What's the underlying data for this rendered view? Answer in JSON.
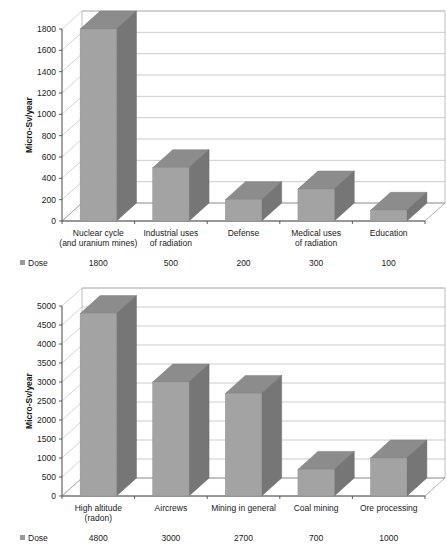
{
  "chart_data": [
    {
      "type": "bar",
      "title": "",
      "xlabel": "",
      "ylabel": "Micro-Sv/year",
      "ylim": [
        0,
        1800
      ],
      "ytick_step": 200,
      "yticks": [
        0,
        200,
        400,
        600,
        800,
        1000,
        1200,
        1400,
        1600,
        1800
      ],
      "grid": true,
      "legend": "Dose",
      "legend_position": "bottom-left",
      "categories": [
        "Nuclear cycle\n(and uranium mines)",
        "Industrial uses\nof radiation",
        "Defense",
        "Medical uses\nof radiation",
        "Education"
      ],
      "category_lines": [
        [
          "Nuclear cycle",
          "(and uranium mines)"
        ],
        [
          "Industrial uses",
          "of radiation"
        ],
        [
          "Defense",
          ""
        ],
        [
          "Medical uses",
          "of radiation"
        ],
        [
          "Education",
          ""
        ]
      ],
      "series": [
        {
          "name": "Dose",
          "values": [
            1800,
            500,
            200,
            300,
            100
          ],
          "value_labels": [
            "1800",
            "500",
            "200",
            "300",
            "100"
          ]
        }
      ]
    },
    {
      "type": "bar",
      "title": "",
      "xlabel": "",
      "ylabel": "Micro-Sv/year",
      "ylim": [
        0,
        5000
      ],
      "ytick_step": 500,
      "yticks": [
        0,
        500,
        1000,
        1500,
        2000,
        2500,
        3000,
        3500,
        4000,
        4500,
        5000
      ],
      "grid": true,
      "legend": "Dose",
      "legend_position": "bottom-left",
      "categories": [
        "High altitude\n(radon)",
        "Aircrews",
        "Mining in general",
        "Coal mining",
        "Ore  processing"
      ],
      "category_lines": [
        [
          "High altitude",
          "(radon)"
        ],
        [
          "Aircrews",
          ""
        ],
        [
          "Mining in general",
          ""
        ],
        [
          "Coal mining",
          ""
        ],
        [
          "Ore  processing",
          ""
        ]
      ],
      "series": [
        {
          "name": "Dose",
          "values": [
            4800,
            3000,
            2700,
            700,
            1000
          ],
          "value_labels": [
            "4800",
            "3000",
            "2700",
            "700",
            "1000"
          ]
        }
      ]
    }
  ],
  "colors": {
    "bar_front": "#a3a3a3",
    "bar_side": "#767676",
    "bar_top": "#8c8c8c",
    "gridline": "#b8b8b8",
    "axis": "#4d4d4d",
    "text": "#1a1a1a",
    "background": "#ffffff"
  }
}
